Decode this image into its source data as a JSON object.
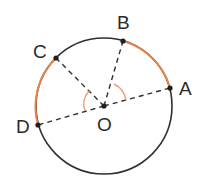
{
  "diagram": {
    "colors": {
      "circle": "#2f2f2f",
      "highlight_arc": "#e8834a",
      "angle_mark": "#e8a07a",
      "dashed": "#2f2f2f"
    },
    "points": {
      "A": {
        "label": "A"
      },
      "B": {
        "label": "B"
      },
      "C": {
        "label": "C"
      },
      "D": {
        "label": "D"
      },
      "O": {
        "label": "O"
      }
    },
    "segments": [
      "OA",
      "OB",
      "OC",
      "OD"
    ],
    "highlighted_arcs": [
      "AB",
      "CD"
    ],
    "marked_angles": [
      "AOB",
      "COD"
    ]
  }
}
